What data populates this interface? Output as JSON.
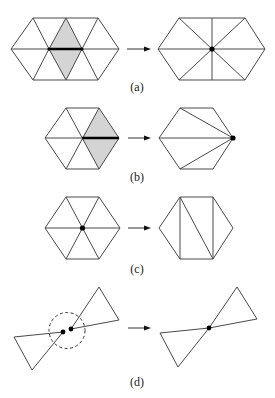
{
  "figure": {
    "panels": [
      {
        "id": "a",
        "label": "(a)",
        "description": "Edge collapse of interior edge: two shaded triangles removed, edge contracted to a single vertex"
      },
      {
        "id": "b",
        "label": "(b)",
        "description": "Edge collapse of edge to boundary vertex: shaded triangles removed, fan re-triangulated"
      },
      {
        "id": "c",
        "label": "(c)",
        "description": "Vertex removal: interior vertex deleted and hole re-triangulated"
      },
      {
        "id": "d",
        "label": "(d)",
        "description": "Vertex pair merge: two nearby vertices within dashed radius merged into one"
      }
    ],
    "colors": {
      "edge": "#4a4a4a",
      "bold_edge": "#000000",
      "shade": "#d4d4d4",
      "vertex": "#000000"
    }
  }
}
